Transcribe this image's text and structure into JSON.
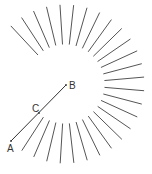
{
  "diagram": {
    "width": 152,
    "height": 174,
    "center": {
      "x": 65,
      "y": 84
    },
    "rays": {
      "inner_radius": 40,
      "outer_radius": 79,
      "start_angle_deg": -133,
      "end_angle_deg": 123,
      "count": 27,
      "color": "#555555"
    },
    "segment": {
      "from": {
        "x": 11,
        "y": 141
      },
      "to": {
        "x": 66,
        "y": 85
      },
      "color": "#333333"
    },
    "points": [
      {
        "label": "A",
        "x": 11,
        "y": 141,
        "label_x": 7,
        "label_y": 152
      },
      {
        "label": "B",
        "x": 66,
        "y": 85,
        "label_x": 69,
        "label_y": 89
      },
      {
        "label": "C",
        "x": 39,
        "y": 113,
        "label_x": 32,
        "label_y": 112
      }
    ]
  }
}
